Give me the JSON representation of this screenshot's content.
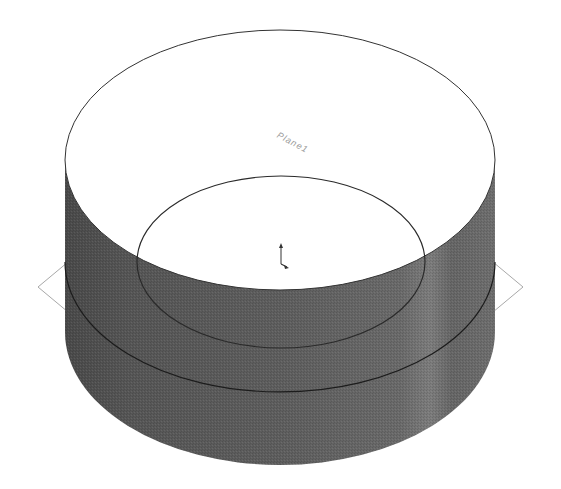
{
  "viewport": {
    "background": "#ffffff"
  },
  "model": {
    "type": "cylinder-with-sketch",
    "side_color": "#5a5a5a",
    "top_face_color": "#ffffff",
    "edge_color": "#222222",
    "plane_label": "Plane1",
    "plane_outline_color": "#a8a8a8"
  },
  "triad": {
    "name": "origin-triad"
  }
}
